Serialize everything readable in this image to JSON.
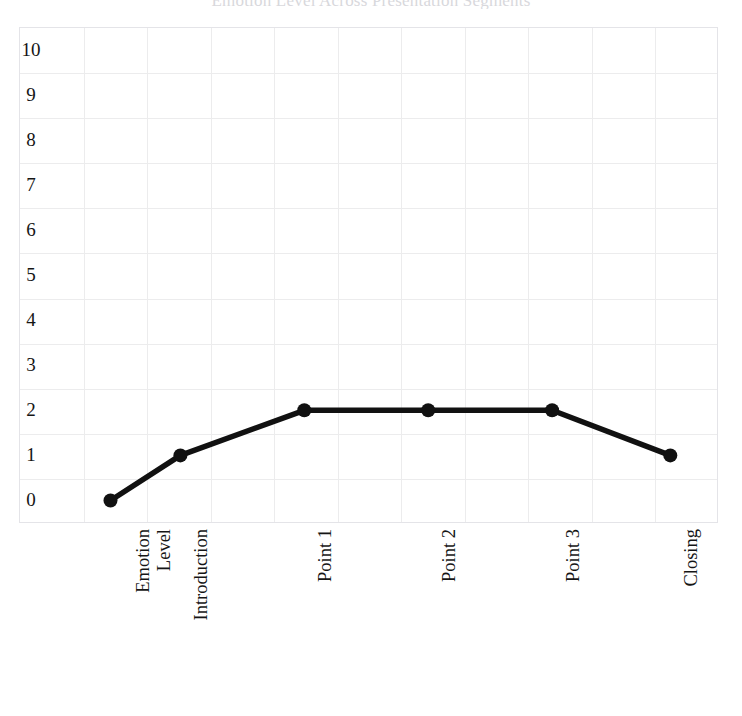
{
  "chart_data": {
    "type": "line",
    "title": "Emotion Level Across Presentation Segments",
    "xlabel": "",
    "ylabel": "",
    "categories": [
      "Emotion Level",
      "Introduction",
      "Point 1",
      "Point 2",
      "Point 3",
      "Closing"
    ],
    "values": [
      0,
      1,
      2,
      2,
      2,
      1
    ],
    "series": [
      {
        "name": "Emotion Level",
        "values": [
          0,
          1,
          2,
          2,
          2,
          1
        ]
      }
    ],
    "ylim": [
      0,
      10
    ],
    "yticks": [
      "0",
      "1",
      "2",
      "3",
      "4",
      "5",
      "6",
      "7",
      "8",
      "9",
      "10"
    ],
    "grid": true,
    "legend": false,
    "legend_position": "none",
    "line_color": "#111111",
    "marker": "circle",
    "marker_color": "#111111",
    "grid_color": "#ececed",
    "frame_color": "#e4e4e8",
    "x_label_rotation": 90,
    "x_columns": 11
  }
}
